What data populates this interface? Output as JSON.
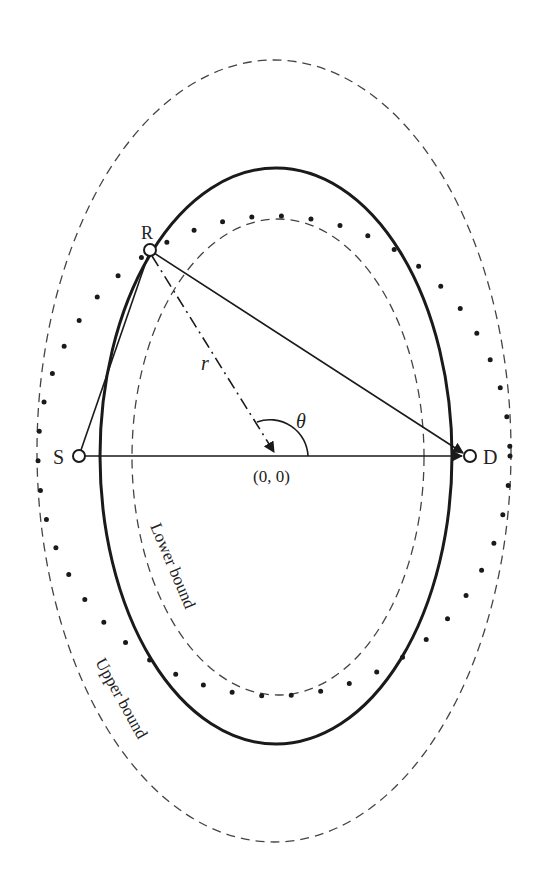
{
  "diagram": {
    "center": {
      "x": 274,
      "y": 456
    },
    "labels": {
      "source": "S",
      "destination": "D",
      "relay": "R",
      "radius": "r",
      "angle": "θ",
      "origin": "(0, 0)",
      "lower_bound": "Lower bound",
      "upper_bound": "Upper bound"
    },
    "nodes": {
      "source": {
        "x": 79,
        "y": 456
      },
      "destination": {
        "x": 470,
        "y": 456
      },
      "relay": {
        "x": 150,
        "y": 250
      }
    },
    "curves": {
      "upper_bound": {
        "style": "dashed",
        "rx": 237,
        "ry": 391
      },
      "actual_region": {
        "style": "solid",
        "rx": 176,
        "ry": 288
      },
      "dotted_region": {
        "style": "dotted",
        "rx": 236,
        "ry": 240
      },
      "lower_bound": {
        "style": "dashed",
        "rx": 146,
        "ry": 238
      }
    },
    "colors": {
      "stroke": "#1a1a1a",
      "dashed": "#444444",
      "background": "#ffffff"
    }
  }
}
